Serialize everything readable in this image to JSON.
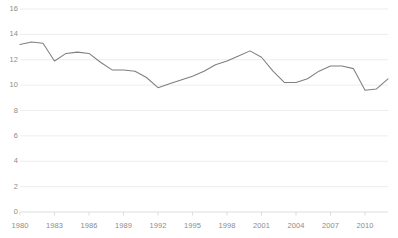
{
  "chart_data": {
    "type": "line",
    "title": "",
    "subtitle": "",
    "xlabel": "",
    "ylabel": "",
    "xlim": [
      1980,
      2012
    ],
    "ylim": [
      0,
      16
    ],
    "grid": true,
    "legend": false,
    "legend_position": "none",
    "y_ticks": [
      16,
      14,
      12,
      10,
      8,
      6,
      4,
      2,
      0
    ],
    "x_ticks": [
      1980,
      1983,
      1986,
      1989,
      1992,
      1995,
      1998,
      2001,
      2004,
      2007,
      2010
    ],
    "x": [
      1980,
      1981,
      1982,
      1983,
      1984,
      1985,
      1986,
      1987,
      1988,
      1989,
      1990,
      1991,
      1992,
      1993,
      1994,
      1995,
      1996,
      1997,
      1998,
      1999,
      2000,
      2001,
      2002,
      2003,
      2004,
      2005,
      2006,
      2007,
      2008,
      2009,
      2010,
      2011,
      2012
    ],
    "series": [
      {
        "name": "value",
        "color": "#7f7f7f",
        "values": [
          13.2,
          13.4,
          13.3,
          11.9,
          12.5,
          12.6,
          12.5,
          11.8,
          11.2,
          11.2,
          11.1,
          10.6,
          9.8,
          10.1,
          10.4,
          10.7,
          11.1,
          11.6,
          11.9,
          12.3,
          12.7,
          12.2,
          11.1,
          10.2,
          10.2,
          10.5,
          11.1,
          11.5,
          11.5,
          11.3,
          9.6,
          9.7,
          10.5
        ]
      }
    ],
    "axis_color": "#d9d9d9",
    "grid_color": "#e8e8e8",
    "tick_label_color": "#8c8c8c",
    "background": "#ffffff"
  },
  "geometry": {
    "plot_left": 20,
    "plot_right": 388,
    "plot_top": 9,
    "plot_bottom": 212
  }
}
